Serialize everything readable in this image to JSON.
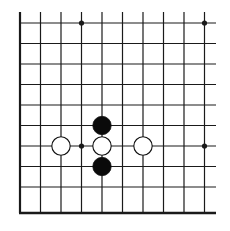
{
  "diagram": {
    "type": "go-board-fragment",
    "columns": 10,
    "rows": 10,
    "visible_edges": [
      "left",
      "bottom"
    ],
    "star_points": [
      [
        3,
        0
      ],
      [
        9,
        0
      ],
      [
        3,
        6
      ],
      [
        9,
        6
      ]
    ],
    "stones": [
      {
        "color": "black",
        "col": 4,
        "row": 5
      },
      {
        "color": "white",
        "col": 2,
        "row": 6
      },
      {
        "color": "white",
        "col": 4,
        "row": 6
      },
      {
        "color": "white",
        "col": 6,
        "row": 6
      },
      {
        "color": "black",
        "col": 4,
        "row": 7
      }
    ],
    "colors": {
      "line": "#1a1a1a",
      "black_stone": "#0a0a0a",
      "white_stone": "#ffffff",
      "background": "#ffffff"
    }
  }
}
